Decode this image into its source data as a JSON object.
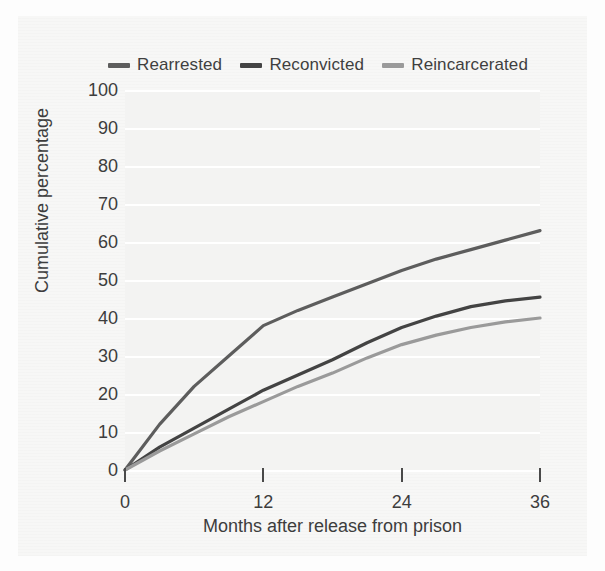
{
  "chart_data": {
    "type": "line",
    "title": "",
    "xlabel": "Months after release from prison",
    "ylabel": "Cumulative percentage",
    "xlim": [
      0,
      36
    ],
    "ylim": [
      0,
      100
    ],
    "xticks": [
      0,
      12,
      24,
      36
    ],
    "yticks": [
      0,
      10,
      20,
      30,
      40,
      50,
      60,
      70,
      80,
      90,
      100
    ],
    "grid": "horizontal",
    "legend_position": "top",
    "x": [
      0,
      3,
      6,
      9,
      12,
      15,
      18,
      21,
      24,
      27,
      30,
      33,
      36
    ],
    "series": [
      {
        "name": "Rearrested",
        "color": "#5d5d5d",
        "values": [
          0,
          12,
          22,
          30,
          38,
          42,
          45.5,
          49,
          52.5,
          55.5,
          58,
          60.5,
          63
        ]
      },
      {
        "name": "Reconvicted",
        "color": "#434343",
        "values": [
          0,
          6,
          11,
          16,
          21,
          25,
          29,
          33.5,
          37.5,
          40.5,
          43,
          44.5,
          45.5
        ]
      },
      {
        "name": "Reincarcerated",
        "color": "#9a9a9a",
        "values": [
          0,
          5,
          9.5,
          14,
          18,
          22,
          25.5,
          29.5,
          33,
          35.5,
          37.5,
          39,
          40
        ]
      }
    ]
  },
  "legend": {
    "items": [
      {
        "label": "Rearrested",
        "color": "#5d5d5d"
      },
      {
        "label": "Reconvicted",
        "color": "#434343"
      },
      {
        "label": "Reincarcerated",
        "color": "#9a9a9a"
      }
    ]
  },
  "axes": {
    "y_title": "Cumulative percentage",
    "x_title": "Months after release from prison",
    "y_ticks": [
      "100",
      "90",
      "80",
      "70",
      "60",
      "50",
      "40",
      "30",
      "20",
      "10",
      "0"
    ],
    "x_ticks": [
      "0",
      "12",
      "24",
      "36"
    ]
  },
  "colors": {
    "page_background": "#fdfdfd",
    "panel_background": "#f7f7f6",
    "plot_background": "#f3f3f2",
    "gridline": "#ffffff",
    "text": "#3d3d3d"
  }
}
